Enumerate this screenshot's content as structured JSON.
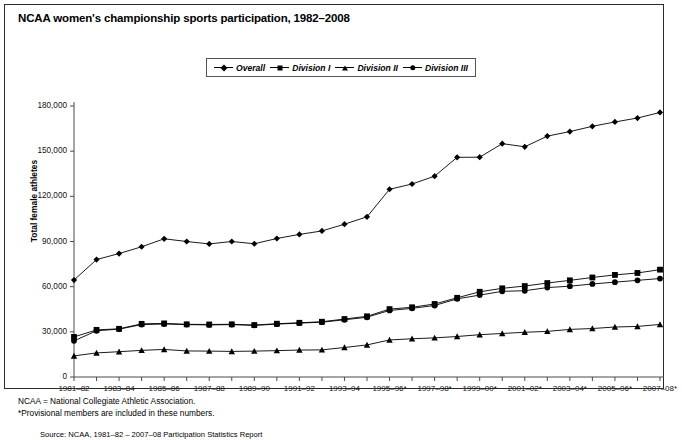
{
  "chart_data": {
    "type": "line",
    "title": "NCAA women's championship sports participation, 1982–2008",
    "xlabel": "",
    "ylabel": "Total female athletes",
    "ylim": [
      0,
      180000
    ],
    "yticks": [
      0,
      30000,
      60000,
      90000,
      120000,
      150000,
      180000
    ],
    "ytick_labels": [
      "0",
      "30,000",
      "60,000",
      "90,000",
      "120,000",
      "150,000",
      "180,000"
    ],
    "grid": false,
    "legend_position": "top-center",
    "categories": [
      "1981–82",
      "1982–83",
      "1983–84",
      "1984–85",
      "1985–86",
      "1986–87",
      "1987–88",
      "1988–89",
      "1989–90",
      "1990–91",
      "1991–92",
      "1992–93",
      "1993–94",
      "1994–95",
      "1995–96*",
      "1996–97*",
      "1997–98*",
      "1998–99*",
      "1999–00*",
      "2000–01*",
      "2001–02*",
      "2002–03*",
      "2003–04*",
      "2004–05*",
      "2005–06*",
      "2006–07*",
      "2007–08*"
    ],
    "xtick_labels": [
      "1981–82",
      "1983–84",
      "1985–86",
      "1987–88",
      "1989–90",
      "1991–92",
      "1993–94",
      "1995–96*",
      "1997–98*",
      "1999–00*",
      "2001–02*",
      "2003–04*",
      "2005–06*",
      "2007–08*"
    ],
    "series": [
      {
        "name": "Overall",
        "marker": "diamond",
        "values": [
          64390,
          78000,
          82000,
          86500,
          91800,
          90000,
          88400,
          90000,
          88500,
          92000,
          94700,
          97000,
          101500,
          106400,
          124700,
          128200,
          133400,
          145900,
          146000,
          155000,
          152900,
          160000,
          163000,
          166500,
          169400,
          172000,
          175700
        ]
      },
      {
        "name": "Division I",
        "marker": "square",
        "values": [
          26600,
          31300,
          32000,
          35300,
          35600,
          35000,
          34900,
          35000,
          34500,
          35400,
          36000,
          36700,
          38500,
          40300,
          45100,
          46300,
          48500,
          52600,
          56600,
          58900,
          60400,
          62400,
          64200,
          66100,
          67800,
          69100,
          71300
        ]
      },
      {
        "name": "Division II",
        "marker": "triangle",
        "values": [
          14000,
          16000,
          16800,
          17700,
          18300,
          17300,
          17200,
          17000,
          17200,
          17500,
          17900,
          18000,
          19600,
          21300,
          24600,
          25400,
          26000,
          26900,
          28100,
          28900,
          29700,
          30300,
          31600,
          32200,
          33200,
          33600,
          34900
        ]
      },
      {
        "name": "Division III",
        "marker": "circle",
        "values": [
          24000,
          30700,
          31800,
          34800,
          35200,
          34800,
          34600,
          34800,
          34300,
          35100,
          35800,
          36400,
          38000,
          39700,
          44200,
          45600,
          47500,
          51900,
          54400,
          56900,
          57300,
          59400,
          60300,
          61800,
          63000,
          64200,
          65400
        ]
      }
    ],
    "annotations": [
      "NCAA = National Collegiate Athletic Association.",
      "*Provisional members are included in these numbers."
    ]
  },
  "footnotes": {
    "line1": "NCAA = National Collegiate Athletic Association.",
    "line2": "*Provisional members are included in these numbers."
  },
  "source": {
    "text": "Source: NCAA, 1981–82 – 2007–08 Participation Statistics Report"
  },
  "legend": {
    "items": [
      {
        "label": "Overall",
        "marker": "diamond"
      },
      {
        "label": "Division I",
        "marker": "square"
      },
      {
        "label": "Division II",
        "marker": "triangle"
      },
      {
        "label": "Division III",
        "marker": "circle"
      }
    ]
  },
  "colors": {
    "line": "#000000",
    "marker": "#000000",
    "axis": "#4a4a4a",
    "frame": "#2b2b2b",
    "background": "#ffffff"
  }
}
